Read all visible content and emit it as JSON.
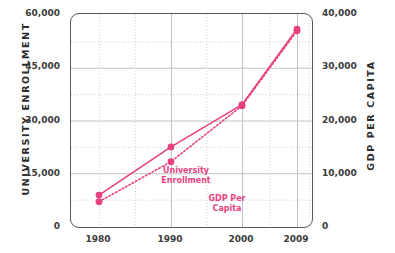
{
  "chart_data": {
    "type": "line",
    "title": "",
    "xlabel": "",
    "categories": [
      "1980",
      "1990",
      "2000",
      "2009"
    ],
    "grid": true,
    "legend_position": "inline-annotations",
    "series": [
      {
        "name": "University Enrollment",
        "axis": "left",
        "style": "solid",
        "color": "#E8417F",
        "values": [
          8800,
          22500,
          34500,
          56000
        ]
      },
      {
        "name": "GDP Per Capita",
        "axis": "right",
        "style": "dotted",
        "color": "#E8417F",
        "values": [
          4600,
          12200,
          22800,
          37000
        ]
      }
    ],
    "y_left": {
      "label": "UNIVERSITY ENROLLMENT",
      "ticks": [
        "0",
        "15,000",
        "30,000",
        "45,000",
        "60,000"
      ],
      "tick_values": [
        0,
        15000,
        30000,
        45000,
        60000
      ],
      "ylim": [
        0,
        60000
      ]
    },
    "y_right": {
      "label": "GDP PER CAPITA",
      "ticks": [
        "0",
        "10,000",
        "20,000",
        "30,000",
        "40,000"
      ],
      "tick_values": [
        0,
        10000,
        20000,
        30000,
        40000
      ],
      "ylim": [
        0,
        40000
      ]
    },
    "annotations": [
      {
        "text": "University\nEnrollment",
        "series": "University Enrollment"
      },
      {
        "text": "GDP Per\nCapita",
        "series": "GDP Per Capita"
      }
    ]
  },
  "colors": {
    "series": "#E8417F",
    "frame": "#55585c",
    "gridline_major": "#b9bcc0",
    "gridline_minor": "#c8cbd0",
    "text": "#2b2b2b"
  }
}
